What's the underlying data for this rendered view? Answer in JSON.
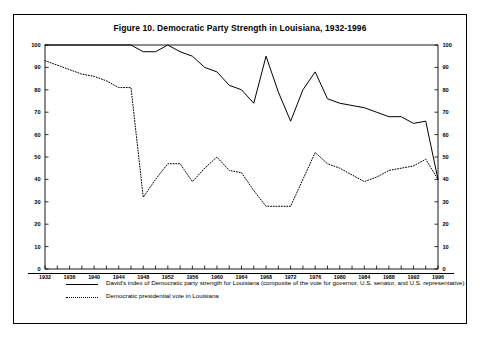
{
  "figure": {
    "title": "Figure 10.  Democratic Party Strength in Louisiana, 1932-1996"
  },
  "legend": {
    "items": [
      {
        "key": "solid-line",
        "label": "David's index of Democratic party strength for Louisiana (composite of the vote for governor, U.S. senator, and U.S. representative)"
      },
      {
        "key": "dotted-line",
        "label": "Democratic presidential vote in Louisiana"
      }
    ]
  },
  "axes": {
    "y_left_ticks": [
      "0",
      "10",
      "20",
      "30",
      "40",
      "50",
      "60",
      "70",
      "80",
      "90",
      "100"
    ],
    "y_right_ticks": [
      "0",
      "10",
      "20",
      "30",
      "40",
      "50",
      "60",
      "70",
      "80",
      "90",
      "100"
    ],
    "x_ticks": [
      "1932",
      "1936",
      "1940",
      "1944",
      "1948",
      "1952",
      "1956",
      "1960",
      "1964",
      "1968",
      "1972",
      "1976",
      "1980",
      "1984",
      "1988",
      "1992",
      "1996"
    ]
  },
  "chart_data": {
    "type": "line",
    "title": "Figure 10.  Democratic Party Strength in Louisiana, 1932-1996",
    "xlabel": "",
    "ylabel": "",
    "xlim": [
      1932,
      1996
    ],
    "ylim": [
      0,
      100
    ],
    "ytick_step": 10,
    "xtick_step": 4,
    "grid": false,
    "legend_position": "below-plot",
    "x": [
      1932,
      1934,
      1936,
      1938,
      1940,
      1942,
      1944,
      1946,
      1948,
      1950,
      1952,
      1954,
      1956,
      1958,
      1960,
      1962,
      1964,
      1966,
      1968,
      1970,
      1972,
      1974,
      1976,
      1978,
      1980,
      1982,
      1984,
      1986,
      1988,
      1990,
      1992,
      1994,
      1996
    ],
    "series": [
      {
        "name": "David's index of Democratic party strength for Louisiana (composite of the vote for governor, U.S. senator, and U.S. representative)",
        "style": "solid",
        "color": "#000000",
        "values": [
          100,
          100,
          100,
          100,
          100,
          100,
          100,
          100,
          97,
          97,
          100,
          97,
          95,
          90,
          88,
          82,
          80,
          74,
          95,
          79,
          66,
          80,
          88,
          76,
          74,
          73,
          72,
          70,
          68,
          68,
          65,
          66,
          40
        ]
      },
      {
        "name": "Democratic presidential vote in Louisiana",
        "style": "dotted",
        "color": "#000000",
        "values": [
          93,
          91,
          89,
          87,
          86,
          84,
          81,
          81,
          32,
          40,
          47,
          47,
          39,
          45,
          50,
          44,
          43,
          35,
          28,
          28,
          28,
          40,
          52,
          47,
          45,
          42,
          39,
          41,
          44,
          45,
          46,
          49,
          40
        ]
      }
    ]
  }
}
